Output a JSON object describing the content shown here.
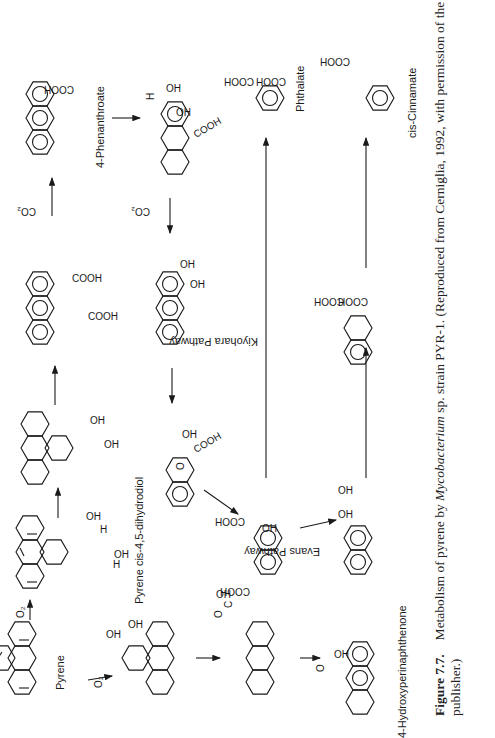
{
  "figure": {
    "orientation": "rotated-90-ccw",
    "compounds": [
      {
        "id": "pyrene",
        "label": "Pyrene"
      },
      {
        "id": "pyrene-cis-45-dihydrodiol",
        "label": "Pyrene cis-4,5-dihydrodiol"
      },
      {
        "id": "pyrene-45-diol",
        "label": ""
      },
      {
        "id": "phenanthrene-45-dicarboxylate",
        "label": ""
      },
      {
        "id": "4-phenanthroate",
        "label": "4-Phenanthroate"
      },
      {
        "id": "phenanthroate-dihydrodiol",
        "label": ""
      },
      {
        "id": "34-dihydroxyphenanthrene",
        "label": ""
      },
      {
        "id": "ring-cleavage-acid",
        "label": ""
      },
      {
        "id": "1-hydroxy-2-naphthoate",
        "label": ""
      },
      {
        "id": "12-dihydroxynaphthalene",
        "label": ""
      },
      {
        "id": "phthalate",
        "label": "Phthalate"
      },
      {
        "id": "naphthalene-dicarboxylate",
        "label": ""
      },
      {
        "id": "cis-cinnamate",
        "label": "cis-Cinnamate"
      },
      {
        "id": "pyrene-12-diol",
        "label": ""
      },
      {
        "id": "perinaphthenone-acid",
        "label": ""
      },
      {
        "id": "4-hydroxyperinaphthenone",
        "label": "4-Hydroxyperinaphthenone"
      }
    ],
    "pathway_labels": {
      "kiyohara": "Kiyohara Pathway",
      "evans": "Evans Pathway"
    },
    "reagents": {
      "o2": "O₂",
      "co2": "CO₂"
    },
    "groups": {
      "cooh": "COOH",
      "oh": "OH",
      "h": "H",
      "o": "O",
      "c": "C"
    }
  },
  "caption": {
    "figure_number": "Figure 7.7.",
    "text_line1_pre": "Metabolism of pyrene by ",
    "text_line1_italic": "Mycobacterium",
    "text_line1_post": " sp. strain PYR-1. (Reproduced from Cerniglia, 1992, with permission of the",
    "text_line2": "publisher.)"
  }
}
